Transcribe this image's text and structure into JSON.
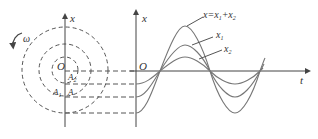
{
  "diagram": {
    "type": "phasor-rotation-and-wave-superposition",
    "left": {
      "axis_label": "x",
      "origin_label": "O",
      "rotation_label": "ω",
      "points": [
        "A2",
        "A1",
        "A"
      ],
      "circles": [
        "A2 radius",
        "A1 radius",
        "A radius"
      ]
    },
    "right": {
      "x_axis_label": "x",
      "t_axis_label": "t",
      "origin_label": "O",
      "curves": [
        {
          "name": "x2",
          "label": "x",
          "sub": "2",
          "amplitude": 13
        },
        {
          "name": "x1",
          "label": "x",
          "sub": "1",
          "amplitude": 26
        },
        {
          "name": "sum",
          "label": "x=x",
          "sub": "1",
          "plus": "+x",
          "sub2": "2",
          "amplitude": 42
        }
      ]
    },
    "colors": {
      "line": "#555555",
      "curve": "#777777",
      "text": "#333333"
    }
  }
}
